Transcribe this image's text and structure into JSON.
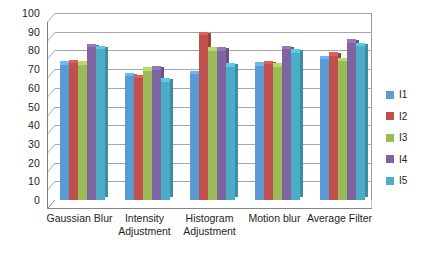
{
  "chart_data": {
    "type": "bar",
    "title": "",
    "subtitle": "",
    "xlabel": "",
    "ylabel": "",
    "ylim": [
      0,
      100
    ],
    "ytick_step": 10,
    "yticks": [
      100,
      90,
      80,
      70,
      60,
      50,
      40,
      30,
      20,
      10,
      0
    ],
    "grid": true,
    "legend_position": "right",
    "style": "3d-clustered-column",
    "categories": [
      "Gaussian Blur",
      "Intensity Adjustment",
      "Histogram Adjustment",
      "Motion blur",
      "Average Filter"
    ],
    "series": [
      {
        "name": "I1",
        "color": "#5b9bd5",
        "values": [
          72.5,
          66.5,
          67.5,
          72.0,
          75.5
        ]
      },
      {
        "name": "I2",
        "color": "#c0504d",
        "values": [
          73.5,
          65.5,
          88.5,
          73.0,
          77.5
        ]
      },
      {
        "name": "I3",
        "color": "#9bbb59",
        "values": [
          72.5,
          69.5,
          80.0,
          71.5,
          74.5
        ]
      },
      {
        "name": "I4",
        "color": "#8064a2",
        "values": [
          82.0,
          70.0,
          80.0,
          81.0,
          84.5
        ]
      },
      {
        "name": "I5",
        "color": "#4bacc6",
        "values": [
          81.0,
          63.5,
          71.5,
          79.0,
          82.5
        ]
      }
    ]
  },
  "legend": {
    "items": [
      {
        "label": "I1"
      },
      {
        "label": "I2"
      },
      {
        "label": "I3"
      },
      {
        "label": "I4"
      },
      {
        "label": "I5"
      }
    ]
  }
}
